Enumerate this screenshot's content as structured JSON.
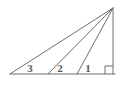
{
  "figure": {
    "background_color": "#ffffff",
    "stroke_color": "#6e6e70",
    "label_color": "#58585a",
    "stroke_width": 1,
    "width": 123,
    "height": 87
  },
  "geometry": {
    "apex": {
      "name": "apex-vertex",
      "x": 113,
      "y": 8
    },
    "left_vertex": {
      "name": "left-vertex",
      "x": 10,
      "y": 74
    },
    "right_vertex": {
      "name": "right-angle-vertex",
      "x": 113,
      "y": 74
    },
    "baseline": {
      "name": "baseline",
      "x1": 10,
      "y1": 74,
      "x2": 115,
      "y2": 74
    },
    "vertical_leg": {
      "name": "vertical-leg",
      "x1": 113,
      "y1": 8,
      "x2": 113,
      "y2": 74
    },
    "hypotenuse": {
      "name": "hypotenuse",
      "x1": 10,
      "y1": 74,
      "x2": 113,
      "y2": 8
    },
    "cevians": [
      {
        "name": "cevian-middle",
        "foot_x": 48,
        "foot_y": 74,
        "apex_x": 113,
        "apex_y": 8
      },
      {
        "name": "cevian-inner",
        "foot_x": 77,
        "foot_y": 74,
        "apex_x": 113,
        "apex_y": 8
      }
    ],
    "right_angle_marker": {
      "name": "right-angle-marker",
      "x": 105,
      "y": 66,
      "size": 8
    }
  },
  "labels": {
    "angle_3": {
      "text": "3",
      "x": 30,
      "y": 72
    },
    "angle_2": {
      "text": "2",
      "x": 60,
      "y": 72
    },
    "angle_1": {
      "text": "1",
      "x": 88,
      "y": 72
    }
  }
}
